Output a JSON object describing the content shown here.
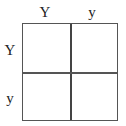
{
  "punnett_square": {
    "column_headers": [
      "Y",
      "y"
    ],
    "row_headers": [
      "Y",
      "y"
    ],
    "cells": [
      [
        "",
        ""
      ],
      [
        "",
        ""
      ]
    ]
  }
}
